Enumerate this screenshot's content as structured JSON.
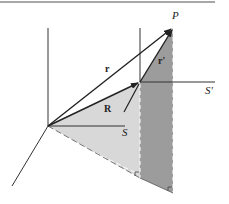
{
  "diagram": {
    "title": "",
    "colors": {
      "line": "#333333",
      "light_plane": "#d6d6d6",
      "dark_plane": "#9a9a9a",
      "rule": "#888888",
      "dashed": "#ffffff"
    },
    "labels": {
      "P": "P",
      "r": "r",
      "r_prime": "r'",
      "R": "R",
      "S": "S",
      "S_prime": "S'"
    },
    "points": {
      "O": [
        48,
        126
      ],
      "O_prime": [
        140,
        82
      ],
      "P": [
        173,
        28
      ]
    }
  }
}
